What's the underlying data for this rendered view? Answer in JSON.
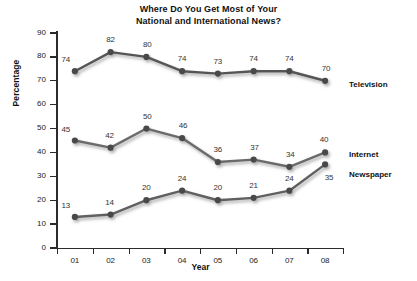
{
  "chart_data": {
    "type": "line",
    "title": "Where Do You Get Most of Your National and International News?",
    "title_line1": "Where Do You Get Most of Your",
    "title_line2": "National and International News?",
    "xlabel": "Year",
    "ylabel": "Percentage",
    "categories": [
      "01",
      "02",
      "03",
      "04",
      "05",
      "06",
      "07",
      "08"
    ],
    "ylim": [
      0,
      90
    ],
    "yticks": [
      0,
      10,
      20,
      30,
      40,
      50,
      60,
      70,
      80,
      90
    ],
    "grid": false,
    "legend_position": "right-inline",
    "series": [
      {
        "name": "Television",
        "color": "#555555",
        "values": [
          74,
          82,
          80,
          74,
          73,
          74,
          74,
          70
        ],
        "label_offsets": [
          {
            "dx": -9,
            "dy": -12
          },
          {
            "dx": 0,
            "dy": -13
          },
          {
            "dx": 1,
            "dy": -13
          },
          {
            "dx": 0,
            "dy": -13
          },
          {
            "dx": 0,
            "dy": -13
          },
          {
            "dx": 0,
            "dy": -13
          },
          {
            "dx": 0,
            "dy": -13
          },
          {
            "dx": 1,
            "dy": -13
          }
        ]
      },
      {
        "name": "Internet",
        "color": "#6b6b6b",
        "values": [
          45,
          42,
          50,
          46,
          36,
          37,
          34,
          40
        ],
        "label_offsets": [
          {
            "dx": -9,
            "dy": -12
          },
          {
            "dx": -1,
            "dy": -13
          },
          {
            "dx": 1,
            "dy": -13
          },
          {
            "dx": 1,
            "dy": -13
          },
          {
            "dx": 0,
            "dy": -13
          },
          {
            "dx": 1,
            "dy": -13
          },
          {
            "dx": 1,
            "dy": -13
          },
          {
            "dx": -1,
            "dy": -13
          }
        ]
      },
      {
        "name": "Newspaper",
        "color": "#606060",
        "values": [
          13,
          14,
          20,
          24,
          20,
          21,
          24,
          35
        ],
        "label_offsets": [
          {
            "dx": -9,
            "dy": -12
          },
          {
            "dx": -1,
            "dy": -13
          },
          {
            "dx": 0,
            "dy": -13
          },
          {
            "dx": 0,
            "dy": -13
          },
          {
            "dx": 0,
            "dy": -13
          },
          {
            "dx": 0,
            "dy": -13
          },
          {
            "dx": 0,
            "dy": -13
          },
          {
            "dx": 4,
            "dy": 13
          }
        ]
      }
    ],
    "legend_labels": [
      {
        "text": "Television",
        "x": 349,
        "y": 85
      },
      {
        "text": "Internet",
        "x": 349,
        "y": 155
      },
      {
        "text": "Newspaper",
        "x": 349,
        "y": 175
      }
    ]
  }
}
